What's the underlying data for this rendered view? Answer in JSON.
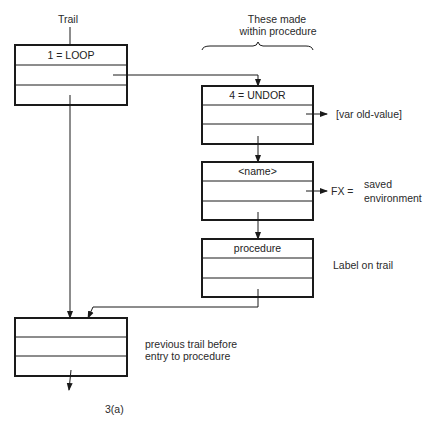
{
  "diagram": {
    "trail_label": "Trail",
    "header_line1": "These made",
    "header_line2": "within procedure",
    "boxes": [
      {
        "id": "loop",
        "label": "1 = LOOP"
      },
      {
        "id": "undor",
        "label": "4 = UNDOR"
      },
      {
        "id": "name",
        "label": "<name>"
      },
      {
        "id": "procedure",
        "label": "procedure"
      },
      {
        "id": "previous",
        "label": ""
      }
    ],
    "annotations": {
      "var_old_value": "[var old-value]",
      "fx": "FX =",
      "saved": "saved",
      "environment": "environment",
      "label_on_trail": "Label on trail",
      "previous_line1": "previous trail before",
      "previous_line2": "entry to procedure"
    },
    "figure_caption": "3(a)",
    "colors": {
      "stroke": "#1a1a1a",
      "text": "#2a2a2a"
    }
  }
}
